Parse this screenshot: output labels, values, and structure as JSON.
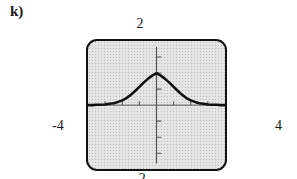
{
  "part": {
    "label": "k)"
  },
  "graph": {
    "window_labels": {
      "ymax": "2",
      "ymin": "-2",
      "xmin": "-4",
      "xmax": "4"
    },
    "frame": {
      "background_color": "#e3e3e3",
      "border_color": "#111111"
    },
    "curve_color": "#111111",
    "axis_color": "#555555"
  },
  "chart_data": {
    "type": "line",
    "title": "",
    "xlabel": "",
    "ylabel": "",
    "xlim": [
      -4,
      4
    ],
    "ylim": [
      -2,
      2
    ],
    "grid": false,
    "legend": null,
    "xticks": [
      -3,
      -2,
      -1,
      1,
      2,
      3
    ],
    "yticks": [
      -1.5,
      -1,
      -0.5,
      0.5,
      1,
      1.5
    ],
    "annotations": [
      "2",
      "-4",
      "4",
      "-2"
    ],
    "series": [
      {
        "name": "bell curve",
        "x": [
          -4.0,
          -3.75,
          -3.5,
          -3.25,
          -3.0,
          -2.75,
          -2.5,
          -2.25,
          -2.0,
          -1.75,
          -1.5,
          -1.25,
          -1.0,
          -0.75,
          -0.5,
          -0.25,
          0.0,
          0.25,
          0.5,
          0.75,
          1.0,
          1.25,
          1.5,
          1.75,
          2.0,
          2.25,
          2.5,
          2.75,
          3.0,
          3.25,
          3.5,
          3.75,
          4.0
        ],
        "y": [
          0.0,
          0.0,
          0.01,
          0.01,
          0.02,
          0.04,
          0.06,
          0.1,
          0.15,
          0.22,
          0.32,
          0.44,
          0.57,
          0.7,
          0.82,
          0.92,
          1.0,
          0.92,
          0.82,
          0.7,
          0.57,
          0.44,
          0.32,
          0.22,
          0.15,
          0.1,
          0.06,
          0.04,
          0.02,
          0.01,
          0.01,
          0.0,
          0.0
        ]
      }
    ]
  }
}
